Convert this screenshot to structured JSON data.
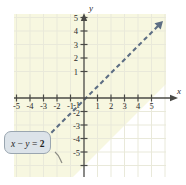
{
  "figure": {
    "kind": "coordinate-plane-graph",
    "colors": {
      "shade_fill": "#f7f7e0",
      "grid_line": "#e6e6d2",
      "axis": "#4a4a46",
      "boundary_line": "#5d6e84",
      "callout_bg": "#dce3e9",
      "callout_border": "#9aa6b0",
      "leader_line": "#8c8c84",
      "page_bg": "#ffffff"
    }
  },
  "chart_data": {
    "type": "line",
    "title": "",
    "xlabel": "x",
    "ylabel": "y",
    "xlim": [
      -6.2,
      6.2
    ],
    "ylim": [
      -6.4,
      6.2
    ],
    "grid": true,
    "legend": "none",
    "x_ticks": [
      -5,
      -4,
      -3,
      -2,
      -1,
      1,
      2,
      3,
      4,
      5
    ],
    "x_tick_labels": [
      "-5",
      "-4",
      "-3",
      "-2",
      "-1",
      "1",
      "2",
      "3",
      "4",
      "5"
    ],
    "y_ticks": [
      -5,
      -4,
      -3,
      -2,
      -1,
      1,
      2,
      3,
      4,
      5
    ],
    "y_tick_labels": [
      "-5",
      "-4",
      "-3",
      "-2",
      "-1",
      "1",
      "2",
      "3",
      "4",
      "5"
    ],
    "series": [
      {
        "name": "x - y = 2",
        "equation": "x - y = 2",
        "slope": 1,
        "y_intercept": -2,
        "x_intercept": 2,
        "style": "dashed",
        "color": "#5d6e84",
        "arrow_both_ends": true,
        "points": [
          [
            -3.6,
            -5.6
          ],
          [
            5.6,
            3.6
          ]
        ]
      }
    ],
    "shaded_region": {
      "description": "region above and left of the dashed line",
      "inequality": "x - y < 2",
      "fill": "#f7f7e0"
    },
    "annotations": [
      {
        "id": "line-callout",
        "text_plain": "x - y = 2",
        "parts": [
          {
            "text": "x",
            "style": "italic"
          },
          {
            "text": " − ",
            "style": "normal"
          },
          {
            "text": "y",
            "style": "italic"
          },
          {
            "text": " = ",
            "style": "normal"
          },
          {
            "text": "2",
            "style": "bold"
          }
        ],
        "points_to": "boundary-line"
      }
    ]
  },
  "axes": {
    "x_axis_label": "x",
    "y_axis_label": "y"
  }
}
